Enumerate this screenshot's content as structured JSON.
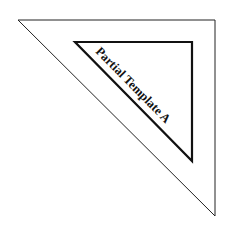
{
  "diagram": {
    "label": "Partial Template A",
    "outer_triangle": {
      "points": "18,20 215,20 215,216",
      "stroke": "#222222"
    },
    "inner_triangle": {
      "points": "75,42 192,42 192,161",
      "stroke": "#111111"
    }
  }
}
